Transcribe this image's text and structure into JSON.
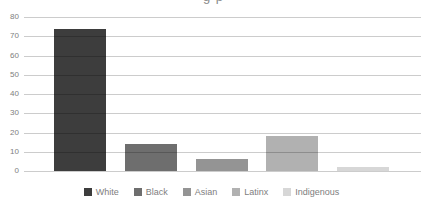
{
  "chart_data": {
    "type": "bar",
    "title_cropped_fragment": "g p",
    "categories": [
      "White",
      "Black",
      "Asian",
      "Latinx",
      "Indigenous"
    ],
    "values": [
      74,
      14,
      6,
      18,
      2
    ],
    "series_colors": [
      "#3d3d3d",
      "#6e6e6e",
      "#949494",
      "#b1b1b1",
      "#d7d7d7"
    ],
    "xlabel": "",
    "ylabel": "",
    "ylim": [
      0,
      80
    ],
    "yticks": [
      0,
      10,
      20,
      30,
      40,
      50,
      60,
      70,
      80
    ],
    "grid": true,
    "legend_position": "bottom"
  },
  "colors": {
    "background": "#ffffff",
    "gridline": "#cccccc",
    "axis_label_text": "#7e7e7e",
    "legend_text": "#7e7e7e"
  }
}
